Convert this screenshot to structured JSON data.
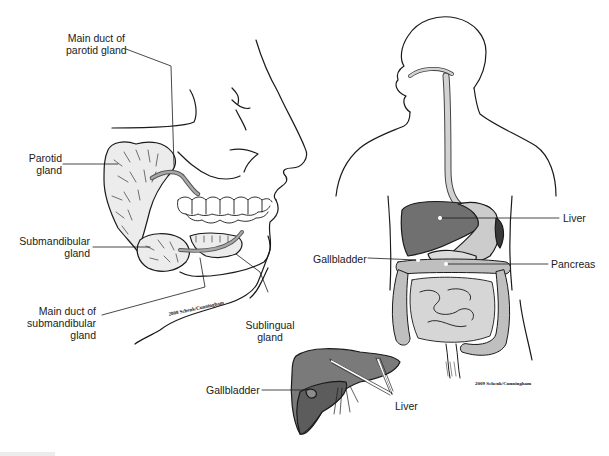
{
  "figure": {
    "panels": [
      {
        "id": "salivary-glands",
        "description": "Lateral view of head showing salivary glands",
        "labels": [
          {
            "key": "main_duct_parotid",
            "text_lines": [
              "Main duct of",
              "parotid gland"
            ]
          },
          {
            "key": "parotid",
            "text_lines": [
              "Parotid",
              "gland"
            ]
          },
          {
            "key": "submandibular",
            "text_lines": [
              "Submandibular",
              "gland"
            ]
          },
          {
            "key": "main_duct_submandibular",
            "text_lines": [
              "Main duct of",
              "submandibular",
              "gland"
            ]
          },
          {
            "key": "sublingual",
            "text_lines": [
              "Sublingual",
              "gland"
            ]
          }
        ],
        "credit": "2008 Schenk/Cunningham"
      },
      {
        "id": "digestive-tract",
        "description": "Torso outline showing digestive organs",
        "labels": [
          {
            "key": "liver",
            "text_lines": [
              "Liver"
            ]
          },
          {
            "key": "gallbladder",
            "text_lines": [
              "Gallbladder"
            ]
          },
          {
            "key": "pancreas",
            "text_lines": [
              "Pancreas"
            ]
          }
        ],
        "credit": "2009 Schenk/Cunningham"
      },
      {
        "id": "liver-inset",
        "description": "Liver with gallbladder inset",
        "labels": [
          {
            "key": "gallbladder",
            "text_lines": [
              "Gallbladder"
            ]
          },
          {
            "key": "liver",
            "text_lines": [
              "Liver"
            ]
          }
        ]
      }
    ],
    "colors": {
      "line": "#1a1a1a",
      "gland_fill": "#e8e8e8",
      "liver_fill": "#6e6e6e",
      "liver_dark": "#555555",
      "stomach_fill": "#c8c8c8",
      "intestine_fill": "#bdbdbd",
      "esophagus_fill": "#cfcfcf",
      "duct_fill": "#9a9a9a"
    }
  }
}
